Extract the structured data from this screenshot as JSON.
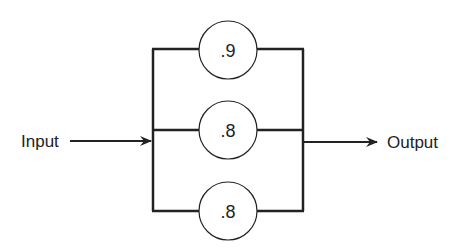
{
  "diagram": {
    "type": "parallel-reliability-block",
    "input_label": "Input",
    "output_label": "Output",
    "components": [
      {
        "label": ".9"
      },
      {
        "label": ".8"
      },
      {
        "label": ".8"
      }
    ],
    "colors": {
      "stroke": "#222222",
      "background": "#ffffff"
    }
  }
}
